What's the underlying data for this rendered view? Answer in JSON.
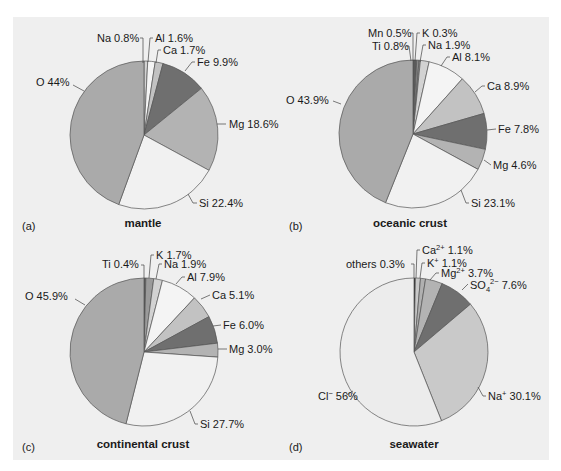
{
  "chart_data": [
    {
      "type": "pie",
      "panel": "(a)",
      "title": "mantle",
      "slices": [
        {
          "label": "Na",
          "value": 0.8,
          "text": "Na 0.8%",
          "color": "#d2d2d2"
        },
        {
          "label": "Al",
          "value": 1.6,
          "text": "Al 1.6%",
          "color": "#f4f4f4"
        },
        {
          "label": "Ca",
          "value": 1.7,
          "text": "Ca 1.7%",
          "color": "#c2c2c2"
        },
        {
          "label": "Fe",
          "value": 9.9,
          "text": "Fe 9.9%",
          "color": "#6f6f6f"
        },
        {
          "label": "Mg",
          "value": 18.6,
          "text": "Mg 18.6%",
          "color": "#b3b3b3"
        },
        {
          "label": "Si",
          "value": 22.4,
          "text": "Si 22.4%",
          "color": "#f1f1f1"
        },
        {
          "label": "O",
          "value": 44,
          "text": "O 44%",
          "color": "#aaaaaa"
        }
      ]
    },
    {
      "type": "pie",
      "panel": "(b)",
      "title": "oceanic crust",
      "slices": [
        {
          "label": "Ti",
          "value": 0.8,
          "text": "Ti 0.8%",
          "color": "#5a5a5a"
        },
        {
          "label": "Mn",
          "value": 0.5,
          "text": "Mn 0.5%",
          "color": "#8a8a8a"
        },
        {
          "label": "K",
          "value": 0.3,
          "text": "K 0.3%",
          "color": "#9a9a9a"
        },
        {
          "label": "Na",
          "value": 1.9,
          "text": "Na 1.9%",
          "color": "#d2d2d2"
        },
        {
          "label": "Al",
          "value": 8.1,
          "text": "Al 8.1%",
          "color": "#f4f4f4"
        },
        {
          "label": "Ca",
          "value": 8.9,
          "text": "Ca 8.9%",
          "color": "#c2c2c2"
        },
        {
          "label": "Fe",
          "value": 7.8,
          "text": "Fe 7.8%",
          "color": "#6f6f6f"
        },
        {
          "label": "Mg",
          "value": 4.6,
          "text": "Mg 4.6%",
          "color": "#b3b3b3"
        },
        {
          "label": "Si",
          "value": 23.1,
          "text": "Si 23.1%",
          "color": "#f1f1f1"
        },
        {
          "label": "O",
          "value": 43.9,
          "text": "O 43.9%",
          "color": "#aaaaaa"
        }
      ]
    },
    {
      "type": "pie",
      "panel": "(c)",
      "title": "continental crust",
      "slices": [
        {
          "label": "Ti",
          "value": 0.4,
          "text": "Ti 0.4%",
          "color": "#5a5a5a"
        },
        {
          "label": "K",
          "value": 1.7,
          "text": "K 1.7%",
          "color": "#9a9a9a"
        },
        {
          "label": "Na",
          "value": 1.9,
          "text": "Na 1.9%",
          "color": "#d2d2d2"
        },
        {
          "label": "Al",
          "value": 7.9,
          "text": "Al 7.9%",
          "color": "#f4f4f4"
        },
        {
          "label": "Ca",
          "value": 5.1,
          "text": "Ca 5.1%",
          "color": "#c2c2c2"
        },
        {
          "label": "Fe",
          "value": 6.0,
          "text": "Fe 6.0%",
          "color": "#6f6f6f"
        },
        {
          "label": "Mg",
          "value": 3.0,
          "text": "Mg 3.0%",
          "color": "#b3b3b3"
        },
        {
          "label": "Si",
          "value": 27.7,
          "text": "Si 27.7%",
          "color": "#f1f1f1"
        },
        {
          "label": "O",
          "value": 45.9,
          "text": "O 45.9%",
          "color": "#aaaaaa"
        }
      ]
    },
    {
      "type": "pie",
      "panel": "(d)",
      "title": "seawater",
      "slices": [
        {
          "label": "others",
          "value": 0.3,
          "text": "others 0.3%",
          "color": "#111111"
        },
        {
          "label": "Ca2+",
          "value": 1.1,
          "text": "Ca²⁺ 1.1%",
          "color": "#c8c8c8"
        },
        {
          "label": "K+",
          "value": 1.1,
          "text": "K⁺ 1.1%",
          "color": "#b0b0b0"
        },
        {
          "label": "Mg2+",
          "value": 3.7,
          "text": "Mg²⁺ 3.7%",
          "color": "#b3b3b3"
        },
        {
          "label": "SO4 2-",
          "value": 7.6,
          "text": "SO₄²⁻ 7.6%",
          "color": "#6f6f6f"
        },
        {
          "label": "Na+",
          "value": 30.1,
          "text": "Na⁺ 30.1%",
          "color": "#c9c9c9"
        },
        {
          "label": "Cl-",
          "value": 56,
          "text": "Cl⁻ 56%",
          "color": "#ececec"
        }
      ]
    }
  ],
  "figure": {
    "panels": [
      {
        "tag": "(a)",
        "title": "mantle"
      },
      {
        "tag": "(b)",
        "title": "oceanic crust"
      },
      {
        "tag": "(c)",
        "title": "continental crust"
      },
      {
        "tag": "(d)",
        "title": "seawater"
      }
    ]
  }
}
